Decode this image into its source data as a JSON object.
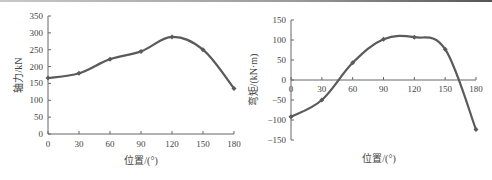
{
  "chart_data": [
    {
      "type": "line",
      "title": "",
      "xlabel": "位置/(°)",
      "ylabel": "轴力/kN",
      "x": [
        0,
        30,
        60,
        90,
        120,
        150,
        180
      ],
      "series": [
        {
          "name": "轴力",
          "values": [
            166,
            180,
            222,
            245,
            288,
            250,
            135
          ]
        }
      ],
      "xticks": [
        "0",
        "30",
        "60",
        "90",
        "120",
        "150",
        "180"
      ],
      "yticks": [
        "0",
        "50",
        "100",
        "150",
        "200",
        "250",
        "300",
        "350"
      ],
      "xlim": [
        0,
        180
      ],
      "ylim": [
        0,
        350
      ],
      "grid": false,
      "color": "#5a5a5a"
    },
    {
      "type": "line",
      "title": "",
      "xlabel": "位置/(°)",
      "ylabel": "弯矩/(kN·m)",
      "x": [
        0,
        30,
        60,
        90,
        120,
        150,
        180
      ],
      "series": [
        {
          "name": "弯矩",
          "values": [
            -92,
            -50,
            43,
            102,
            107,
            77,
            -124
          ]
        }
      ],
      "xticks": [
        "0",
        "30",
        "60",
        "90",
        "120",
        "150",
        "180"
      ],
      "yticks": [
        "-150",
        "-100",
        "-50",
        "0",
        "50",
        "100",
        "150"
      ],
      "xlim": [
        0,
        180
      ],
      "ylim": [
        -150,
        150
      ],
      "grid": false,
      "color": "#5a5a5a"
    }
  ]
}
